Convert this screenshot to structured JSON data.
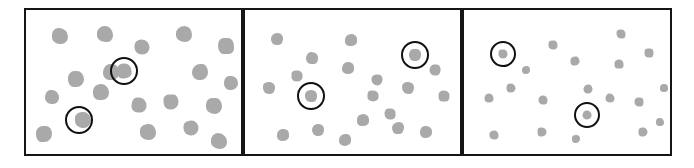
{
  "figure": {
    "type": "stimulus-array",
    "background_color": "#ffffff",
    "border_color": "#151515",
    "dot_color": "#a9a9a9",
    "marker_color": "#111111",
    "panel_count": 3
  },
  "panels": [
    {
      "id": "panel-1",
      "label": "panel-1",
      "x": 24,
      "y": 8,
      "width": 219,
      "height": 148,
      "dot_size": 16,
      "dot_count": 20,
      "marked_count": 2,
      "dots": [
        {
          "x": 34,
          "y": 26,
          "size": 16
        },
        {
          "x": 79,
          "y": 24,
          "size": 16
        },
        {
          "x": 116,
          "y": 37,
          "size": 15
        },
        {
          "x": 158,
          "y": 24,
          "size": 16
        },
        {
          "x": 200,
          "y": 36,
          "size": 16
        },
        {
          "x": 50,
          "y": 69,
          "size": 16
        },
        {
          "x": 85,
          "y": 62,
          "size": 16
        },
        {
          "x": 98,
          "y": 61,
          "size": 15
        },
        {
          "x": 174,
          "y": 62,
          "size": 16
        },
        {
          "x": 26,
          "y": 87,
          "size": 14
        },
        {
          "x": 145,
          "y": 92,
          "size": 15
        },
        {
          "x": 57,
          "y": 110,
          "size": 16
        },
        {
          "x": 122,
          "y": 122,
          "size": 16
        },
        {
          "x": 165,
          "y": 118,
          "size": 15
        },
        {
          "x": 188,
          "y": 96,
          "size": 16
        },
        {
          "x": 193,
          "y": 131,
          "size": 16
        },
        {
          "x": 18,
          "y": 124,
          "size": 16
        },
        {
          "x": 75,
          "y": 82,
          "size": 16
        },
        {
          "x": 113,
          "y": 95,
          "size": 15
        },
        {
          "x": 205,
          "y": 73,
          "size": 14
        }
      ],
      "markers": [
        {
          "x": 98,
          "y": 61,
          "radius": 14
        },
        {
          "x": 53,
          "y": 110,
          "radius": 14
        }
      ]
    },
    {
      "id": "panel-2",
      "label": "panel-2",
      "x": 243,
      "y": 8,
      "width": 219,
      "height": 148,
      "dot_size": 11,
      "dot_count": 20,
      "marked_count": 2,
      "dots": [
        {
          "x": 32,
          "y": 29,
          "size": 12
        },
        {
          "x": 106,
          "y": 30,
          "size": 12
        },
        {
          "x": 170,
          "y": 45,
          "size": 12
        },
        {
          "x": 67,
          "y": 48,
          "size": 12
        },
        {
          "x": 103,
          "y": 58,
          "size": 12
        },
        {
          "x": 24,
          "y": 78,
          "size": 12
        },
        {
          "x": 66,
          "y": 86,
          "size": 12
        },
        {
          "x": 128,
          "y": 86,
          "size": 11
        },
        {
          "x": 163,
          "y": 78,
          "size": 12
        },
        {
          "x": 199,
          "y": 86,
          "size": 11
        },
        {
          "x": 118,
          "y": 110,
          "size": 12
        },
        {
          "x": 153,
          "y": 118,
          "size": 12
        },
        {
          "x": 181,
          "y": 122,
          "size": 12
        },
        {
          "x": 38,
          "y": 125,
          "size": 12
        },
        {
          "x": 73,
          "y": 120,
          "size": 12
        },
        {
          "x": 100,
          "y": 130,
          "size": 12
        },
        {
          "x": 145,
          "y": 104,
          "size": 11
        },
        {
          "x": 190,
          "y": 60,
          "size": 11
        },
        {
          "x": 52,
          "y": 66,
          "size": 11
        },
        {
          "x": 132,
          "y": 70,
          "size": 11
        }
      ],
      "markers": [
        {
          "x": 170,
          "y": 45,
          "radius": 14
        },
        {
          "x": 66,
          "y": 86,
          "radius": 14
        }
      ]
    },
    {
      "id": "panel-3",
      "label": "panel-3",
      "x": 462,
      "y": 8,
      "width": 210,
      "height": 148,
      "dot_size": 8,
      "dot_count": 20,
      "marked_count": 2,
      "dots": [
        {
          "x": 39,
          "y": 44,
          "size": 9
        },
        {
          "x": 89,
          "y": 35,
          "size": 9
        },
        {
          "x": 157,
          "y": 24,
          "size": 9
        },
        {
          "x": 111,
          "y": 51,
          "size": 9
        },
        {
          "x": 155,
          "y": 54,
          "size": 9
        },
        {
          "x": 185,
          "y": 43,
          "size": 9
        },
        {
          "x": 47,
          "y": 78,
          "size": 9
        },
        {
          "x": 25,
          "y": 88,
          "size": 9
        },
        {
          "x": 79,
          "y": 90,
          "size": 9
        },
        {
          "x": 124,
          "y": 79,
          "size": 9
        },
        {
          "x": 146,
          "y": 88,
          "size": 9
        },
        {
          "x": 175,
          "y": 92,
          "size": 9
        },
        {
          "x": 123,
          "y": 105,
          "size": 9
        },
        {
          "x": 30,
          "y": 125,
          "size": 9
        },
        {
          "x": 78,
          "y": 122,
          "size": 9
        },
        {
          "x": 179,
          "y": 122,
          "size": 9
        },
        {
          "x": 200,
          "y": 78,
          "size": 8
        },
        {
          "x": 112,
          "y": 129,
          "size": 8
        },
        {
          "x": 62,
          "y": 60,
          "size": 8
        },
        {
          "x": 196,
          "y": 112,
          "size": 8
        }
      ],
      "markers": [
        {
          "x": 39,
          "y": 44,
          "radius": 13
        },
        {
          "x": 123,
          "y": 105,
          "radius": 13
        }
      ]
    }
  ]
}
